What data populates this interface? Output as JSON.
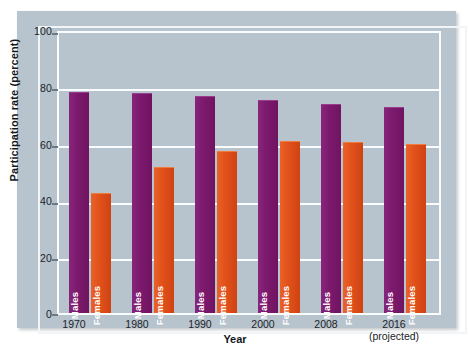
{
  "chart_data": {
    "type": "bar",
    "title": "",
    "xlabel": "Year",
    "ylabel": "Participation rate (percent)",
    "ylim": [
      0,
      100
    ],
    "yticks": [
      0,
      20,
      40,
      60,
      80,
      100
    ],
    "grid": true,
    "legend_position": "in-bar-labels",
    "categories": [
      "1970",
      "1980",
      "1990",
      "2000",
      "2008",
      "2016"
    ],
    "category_sublabels": [
      "",
      "",
      "",
      "",
      "",
      "(projected)"
    ],
    "series": [
      {
        "name": "Males",
        "color": "#7d1a6e",
        "values": [
          79,
          78.5,
          77.5,
          76,
          74.5,
          73.5
        ]
      },
      {
        "name": "Females",
        "color": "#e2521c",
        "values": [
          43,
          52,
          58,
          61.5,
          61,
          60.5
        ]
      }
    ]
  },
  "axis": {
    "y_title": "Participation rate (percent)",
    "x_title": "Year",
    "y_tick_labels": [
      "100",
      "80",
      "60",
      "40",
      "20",
      "0"
    ]
  },
  "bars": {
    "males_label": "Males",
    "females_label": "Females"
  },
  "colors": {
    "males": "#7d1a6e",
    "females": "#e2521c",
    "panel_background": "#b7c3cd",
    "gridline": "#fafcfd",
    "text": "#1d2329",
    "figure_background": "#ffffff"
  }
}
